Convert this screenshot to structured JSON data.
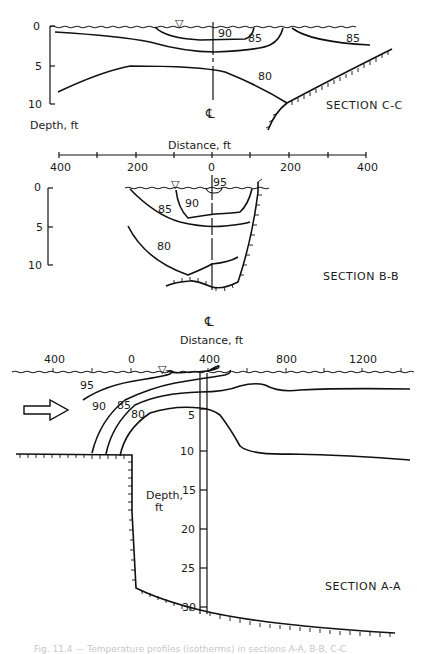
{
  "figure": {
    "caption": "Fig. 11.4 — Temperature profiles (isotherms) in sections A-A, B-B, C-C",
    "sections": [
      {
        "id": "C-C",
        "title": "SECTION C-C",
        "depth_axis_label": "Depth, ft",
        "depth_ticks": [
          "0",
          "5",
          "10"
        ],
        "centerline_symbol": "℄",
        "isotherms": [
          "90",
          "85",
          "85",
          "80"
        ]
      },
      {
        "id": "B-B",
        "title": "SECTION B-B",
        "distance_axis_label": "Distance, ft",
        "distance_ticks": [
          "400",
          "200",
          "0",
          "200",
          "400"
        ],
        "depth_ticks": [
          "0",
          "5",
          "10"
        ],
        "centerline_symbol": "℄",
        "isotherms": [
          "95",
          "90",
          "85",
          "80"
        ]
      },
      {
        "id": "A-A",
        "title": "SECTION A-A",
        "distance_axis_label": "Distance, ft",
        "distance_ticks": [
          "400",
          "0",
          "400",
          "800",
          "1200"
        ],
        "depth_axis_label_line1": "Depth,",
        "depth_axis_label_line2": "ft",
        "depth_ticks": [
          "5",
          "10",
          "15",
          "20",
          "25",
          "30"
        ],
        "isotherms": [
          "95",
          "90",
          "85",
          "80"
        ],
        "flow_arrow": "flow-direction-arrow"
      }
    ],
    "water_surface_symbol": "▽"
  }
}
